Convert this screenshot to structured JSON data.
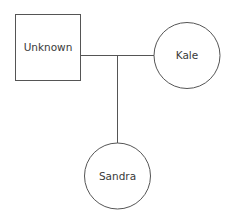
{
  "diagram": {
    "type": "pedigree",
    "stroke_color": "#555555",
    "background": "#ffffff",
    "nodes": [
      {
        "id": "unknown",
        "label": "Unknown",
        "shape": "square",
        "x": 15,
        "y": 14,
        "w": 65,
        "h": 66
      },
      {
        "id": "kale",
        "label": "Kale",
        "shape": "circle",
        "cx": 187,
        "cy": 55,
        "r": 33
      },
      {
        "id": "sandra",
        "label": "Sandra",
        "shape": "circle",
        "cx": 117,
        "cy": 176,
        "r": 33
      }
    ],
    "edges": [
      {
        "id": "partner-line",
        "from": "unknown",
        "to": "kale",
        "kind": "partnership"
      },
      {
        "id": "descent-line",
        "from": "partner-line",
        "to": "sandra",
        "kind": "child"
      }
    ]
  }
}
